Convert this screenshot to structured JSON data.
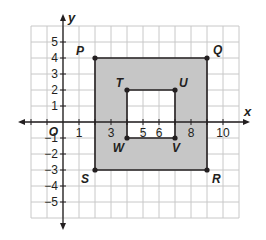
{
  "diagram": {
    "type": "coordinate-plane",
    "axes": {
      "x_label": "x",
      "y_label": "y",
      "origin_label": "O",
      "x_tick_labels": [
        {
          "value": 1,
          "label": "1"
        },
        {
          "value": 3,
          "label": "3"
        },
        {
          "value": 5,
          "label": "5"
        },
        {
          "value": 6,
          "label": "6"
        },
        {
          "value": 8,
          "label": "8"
        },
        {
          "value": 10,
          "label": "10"
        }
      ],
      "y_tick_labels": [
        {
          "value": 5,
          "label": "5"
        },
        {
          "value": 4,
          "label": "4"
        },
        {
          "value": 3,
          "label": "3"
        },
        {
          "value": 2,
          "label": "2"
        },
        {
          "value": 1,
          "label": "1"
        },
        {
          "value": -1,
          "label": "-1"
        },
        {
          "value": -2,
          "label": "-2"
        },
        {
          "value": -3,
          "label": "-3"
        },
        {
          "value": -4,
          "label": "-4"
        },
        {
          "value": -5,
          "label": "-5"
        }
      ],
      "x_range": [
        -2,
        11
      ],
      "y_range": [
        -6,
        6
      ]
    },
    "outer_rectangle": {
      "name": "PQRS",
      "vertices": [
        {
          "label": "P",
          "x": 2,
          "y": 4
        },
        {
          "label": "Q",
          "x": 9,
          "y": 4
        },
        {
          "label": "R",
          "x": 9,
          "y": -3
        },
        {
          "label": "S",
          "x": 2,
          "y": -3
        }
      ]
    },
    "inner_rectangle": {
      "name": "TUVW",
      "vertices": [
        {
          "label": "T",
          "x": 4,
          "y": 2
        },
        {
          "label": "U",
          "x": 7,
          "y": 2
        },
        {
          "label": "V",
          "x": 7,
          "y": -1
        },
        {
          "label": "W",
          "x": 4,
          "y": -1
        }
      ]
    },
    "colors": {
      "shaded_region": "#c6c6c6",
      "grid_line": "#c8c8c8",
      "axis_line": "#231f20",
      "point": "#231f20"
    }
  }
}
